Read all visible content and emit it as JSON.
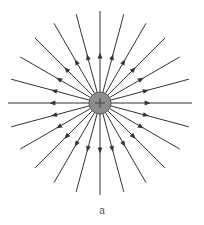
{
  "diagram": {
    "charge": {
      "sign": "+",
      "fill": "#8c8c8c",
      "stroke": "#555555",
      "cx": 100,
      "cy": 103,
      "r": 11
    },
    "field_lines": {
      "count": 24,
      "angle_step_deg": 15,
      "length": 92,
      "arrow_direction": "outward",
      "arrow_position": 0.55,
      "color": "#333333"
    },
    "caption": "a"
  }
}
